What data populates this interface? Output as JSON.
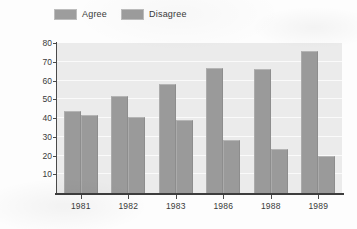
{
  "chart_data": {
    "type": "bar",
    "title": "",
    "subtitle": "",
    "xlabel": "",
    "ylabel": "Percentage",
    "categories": [
      "1981",
      "1982",
      "1983",
      "1986",
      "1988",
      "1989"
    ],
    "series": [
      {
        "name": "Agree",
        "values": [
          43.5,
          52,
          58,
          66.5,
          66,
          75.5
        ]
      },
      {
        "name": "Disagree",
        "values": [
          41.5,
          40.5,
          39,
          28.5,
          23.5,
          19.5
        ]
      }
    ],
    "ylim": [
      0,
      80
    ],
    "yticks": [
      10,
      20,
      30,
      40,
      50,
      60,
      70,
      80
    ],
    "ytick_labels": [
      "10",
      "20",
      "30",
      "40",
      "50",
      "60",
      "70",
      "80"
    ],
    "grid": true,
    "grid_orientation": "horizontal",
    "legend_position": "top-left",
    "colors": {
      "agree_bar": "#9a9a9a",
      "disagree_bar": "#9a9a9a",
      "plot_background": "#ebebeb",
      "gridline": "#fafafa",
      "axis": "#3d3d3d",
      "text": "#3a3a3a",
      "figure_background": "#fdfdfd"
    }
  },
  "legend": {
    "items": [
      {
        "label": "Agree",
        "swatch_icon": "legend-swatch-icon"
      },
      {
        "label": "Disagree",
        "swatch_icon": "legend-swatch-icon"
      }
    ]
  }
}
